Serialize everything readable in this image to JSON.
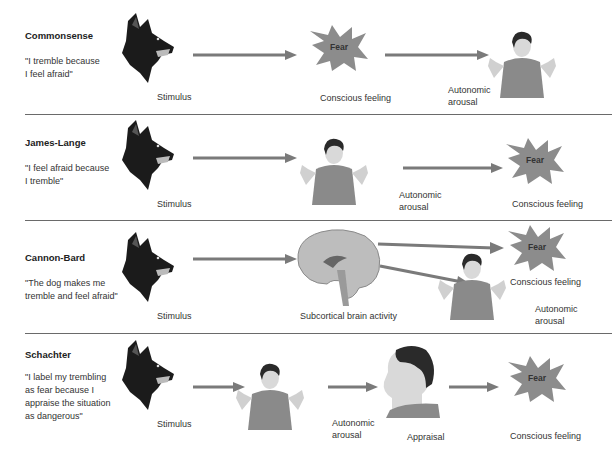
{
  "colors": {
    "arrow": "#7a7a7a",
    "starburst": "#8c8c8c",
    "shirt": "#8a8a8a",
    "skin": "#d8d8d8",
    "hair": "#2a2a2a",
    "dog": "#1a1a1a",
    "divider": "#6a6a6a"
  },
  "rows": [
    {
      "title": "Commonsense",
      "quote_lines": [
        "\"I tremble because",
        "I feel afraid\""
      ],
      "labels": {
        "stimulus": "Stimulus",
        "conscious_feeling": "Conscious feeling",
        "autonomic_1": "Autonomic",
        "autonomic_2": "arousal",
        "fear": "Fear"
      }
    },
    {
      "title": "James-Lange",
      "quote_lines": [
        "\"I feel afraid because",
        "I tremble\""
      ],
      "labels": {
        "stimulus": "Stimulus",
        "autonomic_1": "Autonomic",
        "autonomic_2": "arousal",
        "conscious_feeling": "Conscious feeling",
        "fear": "Fear"
      }
    },
    {
      "title": "Cannon-Bard",
      "quote_lines": [
        "\"The dog makes me",
        "tremble and feel afraid\""
      ],
      "labels": {
        "stimulus": "Stimulus",
        "brain": "Subcortical brain activity",
        "conscious_feeling": "Conscious feeling",
        "autonomic_1": "Autonomic",
        "autonomic_2": "arousal",
        "fear": "Fear"
      }
    },
    {
      "title": "Schachter",
      "quote_lines": [
        "\"I label my trembling",
        "as fear because I",
        "appraise the situation",
        "as dangerous\""
      ],
      "labels": {
        "stimulus": "Stimulus",
        "autonomic_1": "Autonomic",
        "autonomic_2": "arousal",
        "appraisal": "Appraisal",
        "conscious_feeling": "Conscious feeling",
        "fear": "Fear"
      }
    }
  ]
}
